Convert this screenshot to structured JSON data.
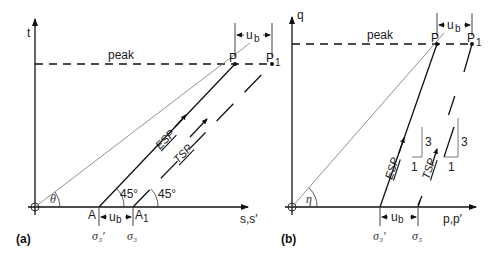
{
  "panel_a": {
    "label": "(a)",
    "y_axis_label": "t",
    "x_axis_label": "s,s′",
    "peak_label": "peak",
    "point_p": "P",
    "point_p1": "P",
    "point_p1_sub": "1",
    "point_a": "A",
    "point_a1": "A",
    "point_a1_sub": "1",
    "ub_top": "u",
    "ub_top_sub": "b",
    "ub_bottom": "u",
    "ub_bottom_sub": "b",
    "sigma3_eff": "σ₃′",
    "sigma3": "σ₃",
    "angle_esp": "45°",
    "angle_tsp": "45°",
    "theta": "θ",
    "esp_label": "ESP",
    "tsp_label": "TSP"
  },
  "panel_b": {
    "label": "(b)",
    "y_axis_label": "q",
    "x_axis_label": "p,p′",
    "peak_label": "peak",
    "point_p": "P",
    "point_p1": "P",
    "point_p1_sub": "1",
    "ub_top": "u",
    "ub_top_sub": "b",
    "ub_bottom": "u",
    "ub_bottom_sub": "b",
    "sigma3_eff": "σ₃′",
    "sigma3": "σ₃",
    "eta": "η",
    "esp_label": "ESP",
    "tsp_label": "TSP",
    "slope1_rise": "3",
    "slope1_run": "1",
    "slope2_rise": "3",
    "slope2_run": "1"
  },
  "colors": {
    "line": "#111111",
    "thin_line": "#777777"
  }
}
